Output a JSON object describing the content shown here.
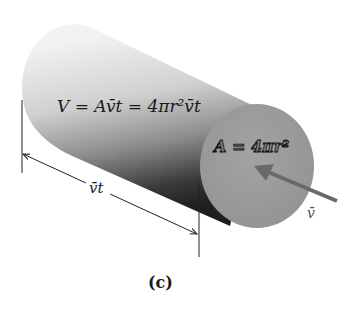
{
  "figure": {
    "label": "(c)",
    "volume_equation": "V = Av̄t = 4πr²v̄t",
    "area_equation": "A = 4πr²",
    "length_label": "v̄t",
    "velocity_label": "v̄"
  },
  "colors": {
    "cylinder_light": "#e6e6e6",
    "cylinder_dark": "#2a2a2a",
    "end_cap": "#9a9a9a",
    "arrow": "#6a6a6a",
    "line": "#222222",
    "background": "#ffffff"
  }
}
